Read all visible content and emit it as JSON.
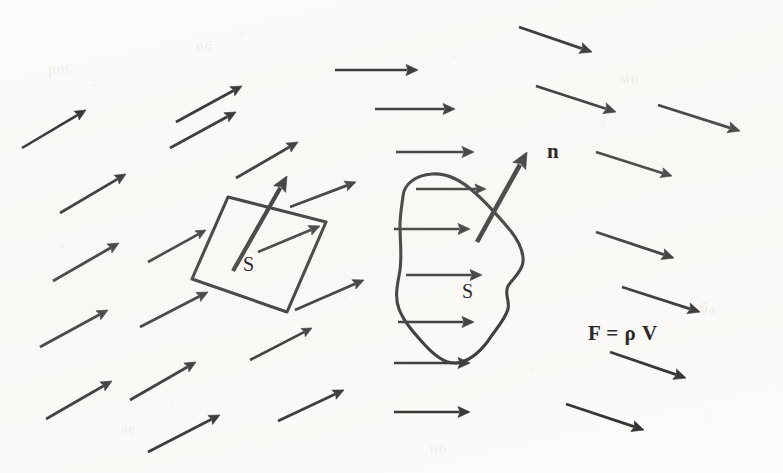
{
  "figure": {
    "background_color": "#fdfcfa",
    "ink_color": "#2b2b2b",
    "width": 783,
    "height": 473
  },
  "labels": {
    "normal_vector": "n",
    "planar_surface": "S",
    "curved_surface": "S",
    "formula": "F = ρ V"
  },
  "ghost_marks": [
    {
      "text": "рис",
      "x": 48,
      "y": 60,
      "rotate": -4
    },
    {
      "text": "об",
      "x": 196,
      "y": 38,
      "rotate": 3
    },
    {
      "text": "ми",
      "x": 620,
      "y": 70,
      "rotate": -2
    },
    {
      "text": "ба",
      "x": 700,
      "y": 300,
      "rotate": 5
    },
    {
      "text": "ле",
      "x": 120,
      "y": 420,
      "rotate": -3
    },
    {
      "text": "но",
      "x": 430,
      "y": 440,
      "rotate": 2
    }
  ],
  "shapes": {
    "parallelogram": {
      "name": "planar-surface-S",
      "points": "228,197 326,222 287,312 192,279"
    },
    "blob": {
      "name": "curved-surface-S",
      "path": "M 403,196 C 404,184 416,175 432,174 C 448,173 462,181 474,192 C 487,203 498,216 510,230 C 518,240 524,250 523,262 C 522,272 513,278 508,286 C 504,294 510,300 508,309 C 505,320 495,330 488,341 C 479,353 468,362 456,363 C 444,364 433,354 424,344 C 414,333 404,322 399,309 C 394,296 398,283 400,270 C 402,255 400,240 400,226 C 400,214 402,205 403,196 Z"
    }
  },
  "chart_data": {
    "type": "vector_field_diagram",
    "field_arrows": [
      {
        "id": 1,
        "x1": 22,
        "y1": 148,
        "x2": 86,
        "y2": 110,
        "head": 11,
        "w": 2.6
      },
      {
        "id": 2,
        "x1": 60,
        "y1": 213,
        "x2": 126,
        "y2": 174,
        "head": 11,
        "w": 2.8
      },
      {
        "id": 3,
        "x1": 53,
        "y1": 281,
        "x2": 119,
        "y2": 243,
        "head": 11,
        "w": 2.8
      },
      {
        "id": 4,
        "x1": 40,
        "y1": 347,
        "x2": 108,
        "y2": 310,
        "head": 11,
        "w": 2.8
      },
      {
        "id": 5,
        "x1": 46,
        "y1": 419,
        "x2": 112,
        "y2": 381,
        "head": 11,
        "w": 2.8
      },
      {
        "id": 6,
        "x1": 170,
        "y1": 148,
        "x2": 236,
        "y2": 112,
        "head": 11,
        "w": 2.8
      },
      {
        "id": 7,
        "x1": 148,
        "y1": 262,
        "x2": 206,
        "y2": 230,
        "head": 10,
        "w": 2.6
      },
      {
        "id": 8,
        "x1": 140,
        "y1": 327,
        "x2": 208,
        "y2": 292,
        "head": 11,
        "w": 2.8
      },
      {
        "id": 9,
        "x1": 130,
        "y1": 400,
        "x2": 196,
        "y2": 362,
        "head": 11,
        "w": 2.8
      },
      {
        "id": 10,
        "x1": 148,
        "y1": 452,
        "x2": 220,
        "y2": 415,
        "head": 11,
        "w": 2.8
      },
      {
        "id": 11,
        "x1": 176,
        "y1": 122,
        "x2": 242,
        "y2": 86,
        "head": 11,
        "w": 2.8
      },
      {
        "id": 12,
        "x1": 236,
        "y1": 178,
        "x2": 298,
        "y2": 142,
        "head": 11,
        "w": 2.8
      },
      {
        "id": 13,
        "x1": 258,
        "y1": 252,
        "x2": 320,
        "y2": 226,
        "head": 11,
        "w": 2.7
      },
      {
        "id": 14,
        "x1": 250,
        "y1": 360,
        "x2": 312,
        "y2": 328,
        "head": 10,
        "w": 2.6
      },
      {
        "id": 15,
        "x1": 278,
        "y1": 421,
        "x2": 344,
        "y2": 390,
        "head": 11,
        "w": 2.8
      },
      {
        "id": 16,
        "x1": 295,
        "y1": 310,
        "x2": 364,
        "y2": 280,
        "head": 11,
        "w": 2.8
      },
      {
        "id": 17,
        "x1": 290,
        "y1": 207,
        "x2": 356,
        "y2": 182,
        "head": 11,
        "w": 2.8
      },
      {
        "id": 18,
        "x1": 335,
        "y1": 70,
        "x2": 418,
        "y2": 70,
        "head": 12,
        "w": 2.6
      },
      {
        "id": 19,
        "x1": 375,
        "y1": 109,
        "x2": 455,
        "y2": 109,
        "head": 12,
        "w": 2.6
      },
      {
        "id": 20,
        "x1": 396,
        "y1": 152,
        "x2": 474,
        "y2": 152,
        "head": 12,
        "w": 2.6
      },
      {
        "id": 21,
        "x1": 416,
        "y1": 189,
        "x2": 486,
        "y2": 189,
        "head": 11,
        "w": 2.4
      },
      {
        "id": 22,
        "x1": 394,
        "y1": 229,
        "x2": 470,
        "y2": 229,
        "head": 12,
        "w": 2.6
      },
      {
        "id": 23,
        "x1": 406,
        "y1": 275,
        "x2": 482,
        "y2": 275,
        "head": 12,
        "w": 2.6
      },
      {
        "id": 24,
        "x1": 398,
        "y1": 322,
        "x2": 474,
        "y2": 322,
        "head": 12,
        "w": 2.6
      },
      {
        "id": 25,
        "x1": 394,
        "y1": 363,
        "x2": 470,
        "y2": 363,
        "head": 12,
        "w": 2.6
      },
      {
        "id": 26,
        "x1": 394,
        "y1": 412,
        "x2": 470,
        "y2": 412,
        "head": 12,
        "w": 2.6
      },
      {
        "id": 27,
        "x1": 519,
        "y1": 27,
        "x2": 592,
        "y2": 52,
        "head": 12,
        "w": 2.8
      },
      {
        "id": 28,
        "x1": 536,
        "y1": 86,
        "x2": 616,
        "y2": 112,
        "head": 12,
        "w": 2.8
      },
      {
        "id": 29,
        "x1": 658,
        "y1": 105,
        "x2": 740,
        "y2": 131,
        "head": 12,
        "w": 2.8
      },
      {
        "id": 30,
        "x1": 596,
        "y1": 152,
        "x2": 672,
        "y2": 176,
        "head": 11,
        "w": 2.6
      },
      {
        "id": 31,
        "x1": 596,
        "y1": 232,
        "x2": 674,
        "y2": 258,
        "head": 12,
        "w": 2.8
      },
      {
        "id": 32,
        "x1": 622,
        "y1": 287,
        "x2": 700,
        "y2": 312,
        "head": 12,
        "w": 2.8
      },
      {
        "id": 33,
        "x1": 610,
        "y1": 352,
        "x2": 686,
        "y2": 378,
        "head": 12,
        "w": 2.8
      },
      {
        "id": 34,
        "x1": 566,
        "y1": 404,
        "x2": 644,
        "y2": 430,
        "head": 12,
        "w": 2.8
      }
    ],
    "normal_arrows": [
      {
        "id": "n-flat",
        "x1": 233,
        "y1": 271,
        "x2": 287,
        "y2": 176,
        "head": 15,
        "w": 4.2,
        "label": ""
      },
      {
        "id": "n-blob",
        "x1": 477,
        "y1": 242,
        "x2": 527,
        "y2": 152,
        "head": 16,
        "w": 4.6,
        "label": "n"
      }
    ]
  }
}
